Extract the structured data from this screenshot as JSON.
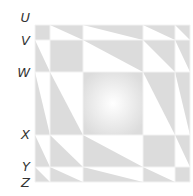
{
  "diagram": {
    "type": "triangular-matrix-grid",
    "labels": [
      "U",
      "V",
      "W",
      "X",
      "Y",
      "Z"
    ],
    "grid": {
      "x_edges": [
        35,
        50,
        83,
        143,
        175,
        190
      ],
      "y_edges": [
        25,
        40,
        72,
        135,
        167,
        182
      ]
    },
    "colors": {
      "fill": "#dcdcdc",
      "background": "#ffffff",
      "gridline": "#f2f2f2",
      "label": "#333333"
    },
    "cells": [
      [
        "solid",
        "upper-right",
        "upper-right",
        "upper-right",
        "upper-right"
      ],
      [
        "lower-left",
        "solid",
        "upper-right",
        "upper-right",
        "upper-right"
      ],
      [
        "lower-left",
        "lower-left",
        "solid-radial",
        "upper-right",
        "upper-right"
      ],
      [
        "lower-left",
        "lower-left",
        "lower-left",
        "solid",
        "upper-right"
      ],
      [
        "lower-left",
        "lower-left",
        "lower-left",
        "lower-left",
        "solid"
      ]
    ]
  }
}
